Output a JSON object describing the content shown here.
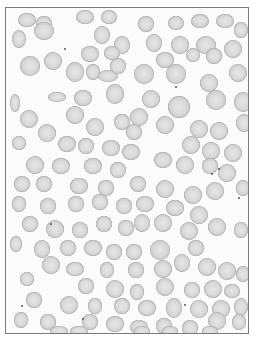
{
  "image": {
    "description": "Microscopy image of a blood smear showing numerous grey red blood cells on a white background with a thin grey border",
    "subject": "red blood cells",
    "border_color": "#7a7a7a",
    "background_color": "#fbfbfb",
    "cell_color": "#d4d4d4",
    "cells": [
      [
        12,
        5,
        18,
        14
      ],
      [
        30,
        8,
        16,
        14
      ],
      [
        70,
        2,
        18,
        14
      ],
      [
        95,
        2,
        16,
        14
      ],
      [
        132,
        8,
        16,
        16
      ],
      [
        162,
        8,
        16,
        14
      ],
      [
        185,
        6,
        18,
        14
      ],
      [
        210,
        6,
        18,
        14
      ],
      [
        228,
        14,
        14,
        16
      ],
      [
        6,
        22,
        14,
        18
      ],
      [
        28,
        14,
        20,
        18
      ],
      [
        88,
        18,
        16,
        18
      ],
      [
        108,
        28,
        16,
        18
      ],
      [
        140,
        26,
        16,
        18
      ],
      [
        165,
        28,
        18,
        18
      ],
      [
        190,
        28,
        20,
        18
      ],
      [
        218,
        32,
        18,
        18
      ],
      [
        75,
        38,
        18,
        16
      ],
      [
        98,
        38,
        16,
        14
      ],
      [
        150,
        44,
        18,
        16
      ],
      [
        180,
        40,
        14,
        14
      ],
      [
        200,
        40,
        16,
        16
      ],
      [
        223,
        56,
        18,
        18
      ],
      [
        14,
        48,
        20,
        20
      ],
      [
        38,
        44,
        18,
        18
      ],
      [
        60,
        54,
        18,
        20
      ],
      [
        80,
        56,
        14,
        16
      ],
      [
        92,
        62,
        20,
        12
      ],
      [
        104,
        50,
        16,
        16
      ],
      [
        128,
        56,
        20,
        20
      ],
      [
        160,
        56,
        20,
        20
      ],
      [
        194,
        66,
        18,
        18
      ],
      [
        4,
        86,
        10,
        18
      ],
      [
        42,
        84,
        18,
        10
      ],
      [
        68,
        82,
        18,
        16
      ],
      [
        100,
        76,
        18,
        20
      ],
      [
        136,
        82,
        18,
        18
      ],
      [
        162,
        88,
        22,
        22
      ],
      [
        200,
        82,
        20,
        20
      ],
      [
        228,
        84,
        18,
        20
      ],
      [
        14,
        102,
        18,
        18
      ],
      [
        32,
        116,
        18,
        18
      ],
      [
        60,
        98,
        18,
        18
      ],
      [
        80,
        110,
        18,
        18
      ],
      [
        108,
        106,
        16,
        16
      ],
      [
        120,
        116,
        16,
        16
      ],
      [
        124,
        100,
        18,
        18
      ],
      [
        150,
        108,
        18,
        18
      ],
      [
        184,
        112,
        18,
        18
      ],
      [
        204,
        114,
        18,
        18
      ],
      [
        230,
        106,
        16,
        18
      ],
      [
        6,
        128,
        14,
        14
      ],
      [
        52,
        128,
        18,
        16
      ],
      [
        72,
        130,
        16,
        16
      ],
      [
        96,
        132,
        18,
        16
      ],
      [
        116,
        136,
        18,
        16
      ],
      [
        148,
        144,
        18,
        16
      ],
      [
        176,
        128,
        18,
        18
      ],
      [
        196,
        134,
        18,
        18
      ],
      [
        218,
        136,
        18,
        18
      ],
      [
        20,
        148,
        18,
        18
      ],
      [
        46,
        150,
        18,
        16
      ],
      [
        78,
        150,
        18,
        16
      ],
      [
        104,
        154,
        16,
        16
      ],
      [
        170,
        148,
        18,
        18
      ],
      [
        196,
        150,
        16,
        16
      ],
      [
        212,
        156,
        18,
        18
      ],
      [
        8,
        168,
        16,
        16
      ],
      [
        30,
        168,
        16,
        16
      ],
      [
        64,
        170,
        18,
        16
      ],
      [
        92,
        172,
        16,
        16
      ],
      [
        124,
        168,
        16,
        16
      ],
      [
        150,
        172,
        18,
        18
      ],
      [
        178,
        178,
        18,
        18
      ],
      [
        200,
        174,
        18,
        18
      ],
      [
        230,
        172,
        14,
        16
      ],
      [
        6,
        188,
        14,
        16
      ],
      [
        34,
        190,
        16,
        16
      ],
      [
        62,
        188,
        16,
        16
      ],
      [
        86,
        186,
        16,
        16
      ],
      [
        110,
        190,
        16,
        16
      ],
      [
        130,
        188,
        18,
        16
      ],
      [
        160,
        192,
        18,
        16
      ],
      [
        184,
        198,
        18,
        18
      ],
      [
        16,
        208,
        16,
        16
      ],
      [
        40,
        212,
        18,
        18
      ],
      [
        66,
        214,
        16,
        16
      ],
      [
        90,
        208,
        16,
        16
      ],
      [
        112,
        212,
        16,
        16
      ],
      [
        128,
        206,
        16,
        18
      ],
      [
        148,
        206,
        18,
        18
      ],
      [
        174,
        214,
        18,
        18
      ],
      [
        202,
        210,
        18,
        18
      ],
      [
        228,
        214,
        14,
        16
      ],
      [
        4,
        228,
        12,
        16
      ],
      [
        28,
        232,
        16,
        18
      ],
      [
        54,
        232,
        16,
        16
      ],
      [
        78,
        232,
        18,
        16
      ],
      [
        100,
        236,
        16,
        16
      ],
      [
        120,
        236,
        16,
        16
      ],
      [
        144,
        232,
        20,
        20
      ],
      [
        182,
        232,
        16,
        16
      ],
      [
        36,
        248,
        18,
        18
      ],
      [
        60,
        254,
        18,
        14
      ],
      [
        94,
        254,
        14,
        16
      ],
      [
        122,
        254,
        16,
        16
      ],
      [
        148,
        252,
        18,
        18
      ],
      [
        168,
        246,
        16,
        18
      ],
      [
        192,
        250,
        18,
        18
      ],
      [
        212,
        254,
        18,
        18
      ],
      [
        230,
        258,
        14,
        16
      ],
      [
        14,
        264,
        14,
        14
      ],
      [
        72,
        270,
        16,
        16
      ],
      [
        100,
        272,
        18,
        18
      ],
      [
        124,
        276,
        14,
        16
      ],
      [
        150,
        270,
        18,
        18
      ],
      [
        178,
        274,
        16,
        16
      ],
      [
        198,
        272,
        18,
        18
      ],
      [
        218,
        276,
        16,
        14
      ],
      [
        20,
        284,
        16,
        16
      ],
      [
        54,
        288,
        18,
        18
      ],
      [
        82,
        290,
        14,
        16
      ],
      [
        108,
        290,
        16,
        16
      ],
      [
        132,
        292,
        18,
        16
      ],
      [
        160,
        290,
        16,
        20
      ],
      [
        184,
        292,
        18,
        18
      ],
      [
        206,
        292,
        18,
        18
      ],
      [
        228,
        290,
        14,
        18
      ],
      [
        8,
        304,
        14,
        16
      ],
      [
        34,
        306,
        16,
        16
      ],
      [
        76,
        306,
        16,
        16
      ],
      [
        100,
        308,
        18,
        16
      ],
      [
        124,
        312,
        18,
        14
      ],
      [
        150,
        310,
        16,
        16
      ],
      [
        176,
        312,
        16,
        16
      ],
      [
        202,
        304,
        18,
        18
      ],
      [
        226,
        306,
        14,
        16
      ],
      [
        44,
        318,
        18,
        10
      ],
      [
        64,
        318,
        18,
        10
      ],
      [
        128,
        318,
        16,
        10
      ],
      [
        156,
        318,
        16,
        10
      ],
      [
        196,
        318,
        16,
        10
      ]
    ],
    "dots": [
      [
        58,
        40
      ],
      [
        169,
        78
      ],
      [
        205,
        165
      ],
      [
        212,
        160
      ],
      [
        178,
        296
      ],
      [
        44,
        215
      ],
      [
        15,
        297
      ],
      [
        76,
        310
      ],
      [
        160,
        326
      ],
      [
        232,
        189
      ]
    ]
  }
}
